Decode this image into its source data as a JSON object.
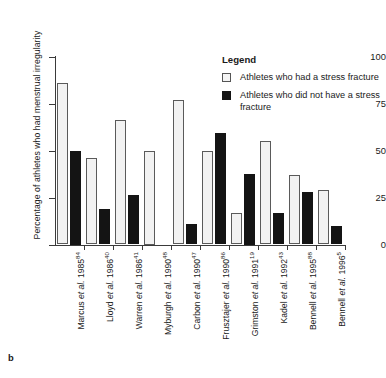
{
  "panel_label": "b",
  "legend": {
    "title": "Legend",
    "entries": [
      {
        "swatch": "light-dotted",
        "label": "Athletes who had a stress fracture"
      },
      {
        "swatch": "solid-black",
        "label": "Athletes who did not have a stress fracture"
      }
    ]
  },
  "colors": {
    "light_bar_fill": "#f2f2f2",
    "light_bar_border": "#5a5a5a",
    "dark_bar_fill": "#141414",
    "axis": "#3a3a3a",
    "text": "#1a1a1a",
    "background": "#ffffff"
  },
  "chart_data": {
    "type": "bar",
    "title": "",
    "xlabel": "",
    "ylabel": "Percentage of athletes who had menstrual irregularity",
    "ylim": [
      0,
      100
    ],
    "yticks": [
      0,
      25,
      50,
      75,
      100
    ],
    "ytick_labels": [
      "0",
      "25",
      "50",
      "75",
      "100"
    ],
    "grid": false,
    "legend_position": "upper-right",
    "categories": [
      "Marcus et al. 1985",
      "Lloyd et al. 1986",
      "Warren et al. 1986",
      "Myburgh et al. 1990",
      "Carbon et al. 1990",
      "Frusztajer et al. 1990",
      "Grimston et al. 1991",
      "Kadel et al. 1992",
      "Bennell et al. 1995",
      "Bennell et al. 1996"
    ],
    "category_refs": [
      "84",
      "40",
      "41",
      "48",
      "47",
      "86",
      "19",
      "43",
      "88",
      "5"
    ],
    "category_authors": [
      "Marcus",
      "Lloyd",
      "Warren",
      "Myburgh",
      "Carbon",
      "Frusztajer",
      "Grimston",
      "Kadel",
      "Bennell",
      "Bennell"
    ],
    "category_years": [
      "1985",
      "1986",
      "1986",
      "1990",
      "1990",
      "1990",
      "1991",
      "1992",
      "1995",
      "1996"
    ],
    "series": [
      {
        "name": "Athletes who had a stress fracture",
        "style": "light-dotted",
        "values": [
          86,
          46,
          66,
          50,
          77,
          49.5,
          17,
          55,
          37,
          29
        ]
      },
      {
        "name": "Athletes who did not have a stress fracture",
        "style": "solid-black",
        "values": [
          50,
          19,
          26.5,
          0,
          11,
          59.5,
          37.5,
          16.5,
          28,
          10
        ]
      }
    ]
  }
}
